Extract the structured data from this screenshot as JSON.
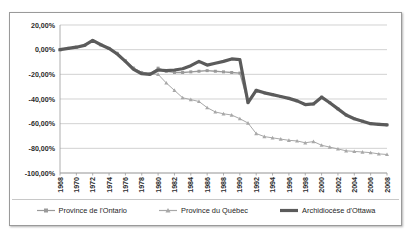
{
  "chart_data": {
    "type": "line",
    "title": "",
    "subtitle": "",
    "xlabel": "",
    "ylabel": "",
    "xlim": [
      1968,
      2008
    ],
    "ylim": [
      -100,
      20
    ],
    "grid": true,
    "grid_axis": "y",
    "legend_position": "bottom",
    "y_tick_labels": [
      "20,00%",
      "0,00%",
      "-20,00%",
      "-40,00%",
      "-60,00%",
      "-80,00%",
      "-100,00%"
    ],
    "y_ticks": [
      20,
      0,
      -20,
      -40,
      -60,
      -80,
      -100
    ],
    "x_tick_labels": [
      "1968",
      "1970",
      "1972",
      "1974",
      "1976",
      "1978",
      "1980",
      "1982",
      "1984",
      "1986",
      "1988",
      "1990",
      "1992",
      "1994",
      "1996",
      "1998",
      "2000",
      "2002",
      "2004",
      "2006",
      "2008"
    ],
    "x": [
      1968,
      1969,
      1970,
      1971,
      1972,
      1973,
      1974,
      1975,
      1976,
      1977,
      1978,
      1979,
      1980,
      1981,
      1982,
      1983,
      1984,
      1985,
      1986,
      1987,
      1988,
      1989,
      1990,
      1991,
      1992,
      1993,
      1994,
      1995,
      1996,
      1997,
      1998,
      1999,
      2000,
      2001,
      2002,
      2003,
      2004,
      2005,
      2006,
      2007,
      2008
    ],
    "series": [
      {
        "name": "Province de l'Ontario",
        "color": "#9a9a9a",
        "marker": "square",
        "line_width": 1.3,
        "values": [
          0.0,
          1.0,
          2.0,
          3.5,
          7.0,
          4.0,
          1.0,
          -3.0,
          -9.0,
          -15.0,
          -18.5,
          -19.5,
          -15.0,
          -17.5,
          -18.5,
          -18.5,
          -18.0,
          -17.5,
          -17.0,
          -17.5,
          -18.0,
          -18.5,
          -19.0,
          -42.5,
          -33.0,
          -35.0,
          -36.5,
          -38.0,
          -39.5,
          -41.5,
          -44.5,
          -44.0,
          -38.5,
          -43.0,
          -48.0,
          -53.0,
          -56.0,
          -58.0,
          -60.0,
          -60.5,
          -61.0
        ]
      },
      {
        "name": "Province du Québec",
        "color": "#a8a8a8",
        "marker": "triangle",
        "line_width": 1.0,
        "values": [
          0.0,
          1.0,
          2.0,
          3.5,
          7.0,
          4.0,
          1.0,
          -3.0,
          -9.0,
          -15.0,
          -18.5,
          -19.5,
          -20.0,
          -27.0,
          -33.0,
          -39.0,
          -40.5,
          -42.0,
          -47.0,
          -50.5,
          -52.0,
          -53.0,
          -56.0,
          -59.5,
          -68.0,
          -70.5,
          -71.5,
          -72.5,
          -73.5,
          -74.0,
          -75.5,
          -74.5,
          -77.5,
          -79.0,
          -80.5,
          -82.0,
          -82.5,
          -83.0,
          -83.5,
          -84.5,
          -85.0
        ]
      },
      {
        "name": "Archidiocèse d'Ottawa",
        "color": "#5b5b5b",
        "marker": "none",
        "line_width": 3.2,
        "values": [
          0.0,
          1.0,
          2.0,
          3.5,
          7.5,
          4.0,
          1.0,
          -3.5,
          -9.5,
          -16.0,
          -19.5,
          -20.0,
          -16.5,
          -17.0,
          -16.5,
          -15.5,
          -13.0,
          -9.5,
          -12.5,
          -11.0,
          -9.5,
          -7.5,
          -8.0,
          -43.0,
          -33.0,
          -35.0,
          -36.5,
          -38.0,
          -39.5,
          -41.5,
          -44.5,
          -44.0,
          -38.5,
          -43.0,
          -48.0,
          -53.0,
          -56.0,
          -58.0,
          -60.0,
          -60.5,
          -61.0
        ]
      }
    ],
    "legend": [
      {
        "label": "Province de l'Ontario",
        "marker": "square",
        "color": "#9a9a9a"
      },
      {
        "label": "Province du Québec",
        "marker": "triangle",
        "color": "#a8a8a8"
      },
      {
        "label": "Archidiocèse d'Ottawa",
        "marker": "none",
        "color": "#5b5b5b"
      }
    ]
  }
}
